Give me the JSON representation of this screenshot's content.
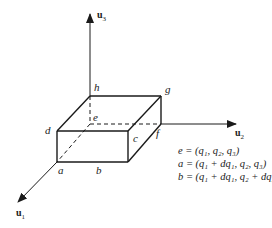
{
  "diagram": {
    "type": "3d-volume-element",
    "axes": {
      "u1": {
        "label": "u",
        "sub": "1"
      },
      "u2": {
        "label": "u",
        "sub": "2"
      },
      "u3": {
        "label": "u",
        "sub": "3"
      }
    },
    "vertices": {
      "a": "a",
      "b": "b",
      "c": "c",
      "d": "d",
      "e": "e",
      "f": "f",
      "g": "g",
      "h": "h"
    },
    "equations": [
      "e = (q₁, q₂, q₃)",
      "a = (q₁ + dq₁, q₂, q₃)",
      "b = (q₁ + dq₁, q₂ + dq₂, q₃)"
    ],
    "colors": {
      "line": "#1a1a1a",
      "background": "#ffffff"
    }
  }
}
